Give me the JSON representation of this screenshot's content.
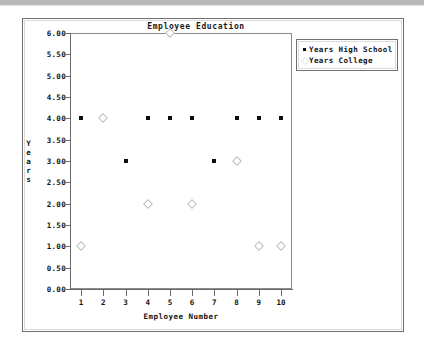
{
  "window": {
    "title_bar_present": true
  },
  "chart_data": {
    "type": "scatter",
    "title": "Employee Education",
    "xlabel": "Employee Number",
    "ylabel": "Years",
    "xlim": [
      0.5,
      10.5
    ],
    "ylim": [
      0.0,
      6.0
    ],
    "grid": false,
    "legend_position": "right",
    "x": [
      1,
      2,
      3,
      4,
      5,
      6,
      7,
      8,
      9,
      10
    ],
    "xticks": [
      "1",
      "2",
      "3",
      "4",
      "5",
      "6",
      "7",
      "8",
      "9",
      "10"
    ],
    "yticks": [
      "0.00",
      "0.50",
      "1.00",
      "1.50",
      "2.00",
      "2.50",
      "3.00",
      "3.50",
      "4.00",
      "4.50",
      "5.00",
      "5.50",
      "6.00"
    ],
    "ytick_values": [
      0.0,
      0.5,
      1.0,
      1.5,
      2.0,
      2.5,
      3.0,
      3.5,
      4.0,
      4.5,
      5.0,
      5.5,
      6.0
    ],
    "series": [
      {
        "name": "Years High School",
        "marker": "filled-square",
        "color": "#0d0d0d",
        "points": [
          {
            "x": 1,
            "y": 4
          },
          {
            "x": 2,
            "y": 4
          },
          {
            "x": 3,
            "y": 3
          },
          {
            "x": 4,
            "y": 4
          },
          {
            "x": 5,
            "y": 4
          },
          {
            "x": 6,
            "y": 4
          },
          {
            "x": 7,
            "y": 3
          },
          {
            "x": 8,
            "y": 4
          },
          {
            "x": 9,
            "y": 4
          },
          {
            "x": 10,
            "y": 4
          }
        ]
      },
      {
        "name": "Years College",
        "marker": "open-diamond",
        "color": "#bdbdbd",
        "points": [
          {
            "x": 1,
            "y": 1
          },
          {
            "x": 2,
            "y": 4
          },
          {
            "x": 4,
            "y": 2
          },
          {
            "x": 5,
            "y": 6
          },
          {
            "x": 6,
            "y": 2
          },
          {
            "x": 8,
            "y": 3
          },
          {
            "x": 9,
            "y": 1
          },
          {
            "x": 10,
            "y": 1
          }
        ]
      }
    ]
  },
  "legend": {
    "entries": [
      {
        "label": "Years High School",
        "marker": "filled-square"
      },
      {
        "label": "Years College",
        "marker": "open-diamond"
      }
    ]
  }
}
